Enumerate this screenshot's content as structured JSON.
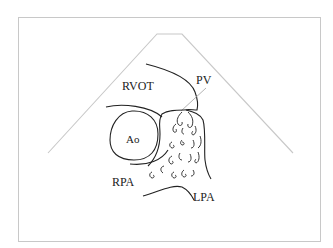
{
  "diagram": {
    "type": "echocardiographic schematic",
    "view": "parasternal short axis at great vessel level",
    "labels": {
      "rvot": "RVOT",
      "pv": "PV",
      "ao": "Ao",
      "rpa": "RPA",
      "lpa": "LPA"
    },
    "colors": {
      "line": "#222222",
      "sector": "#c8c8c8",
      "frame": "#c8c8c8"
    }
  }
}
